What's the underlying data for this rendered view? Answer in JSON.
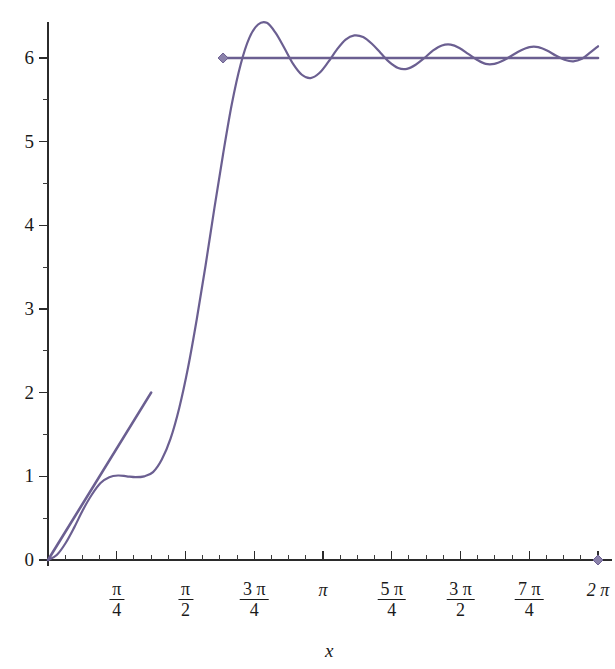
{
  "chart_data": {
    "type": "line",
    "title": "",
    "subtitle": "",
    "xlabel": "x",
    "ylabel": "",
    "grid": false,
    "legend": null,
    "xlim": [
      0,
      6.283185307179586
    ],
    "ylim": [
      0,
      6.45
    ],
    "x_tick_labels": [
      "",
      "π/4",
      "π/2",
      "3π/4",
      "π",
      "5π/4",
      "3π/2",
      "7π/4",
      "2π"
    ],
    "x_tick_values": [
      0,
      0.7853981634,
      1.5707963268,
      2.3561944902,
      3.1415926536,
      3.926990817,
      4.7123889804,
      5.4977871438,
      6.2831853072
    ],
    "x_minor_ticks_per_interval": 4,
    "y_tick_labels": [
      "0",
      "1",
      "2",
      "3",
      "4",
      "5",
      "6"
    ],
    "y_tick_values": [
      0,
      1,
      2,
      3,
      4,
      5,
      6
    ],
    "y_minor_ticks_per_interval": 2,
    "curve_color": "#6b5f91",
    "axis_color": "#2b2b2b",
    "marker_shape": "diamond",
    "markers": [
      {
        "x": 2.0,
        "y": 6.0,
        "label": "left-endpoint-marker"
      },
      {
        "x": 6.283185307179586,
        "y": 0.0,
        "label": "right-endpoint-marker"
      }
    ],
    "series": [
      {
        "name": "fourier-partial-sum",
        "description": "Gibbs-oscillating step approximation rising from 0 to about 6",
        "color": "#6b5f91",
        "points_x": [
          0.0,
          0.1,
          0.2,
          0.3,
          0.4,
          0.5,
          0.6,
          0.7,
          0.8,
          0.9,
          1.0,
          1.1,
          1.2,
          1.3,
          1.4,
          1.5,
          1.6,
          1.7,
          1.8,
          1.9,
          2.0,
          2.1,
          2.2,
          2.3,
          2.4,
          2.5,
          2.6,
          2.7,
          2.8,
          2.9,
          3.0,
          3.1,
          3.2,
          3.3,
          3.4,
          3.5,
          3.6,
          3.7,
          3.8,
          3.9,
          4.0,
          4.1,
          4.2,
          4.3,
          4.4,
          4.5,
          4.6,
          4.7,
          4.8,
          4.9,
          5.0,
          5.1,
          5.2,
          5.3,
          5.4,
          5.5,
          5.6,
          5.7,
          5.8,
          5.9,
          6.0,
          6.1,
          6.2,
          6.2832
        ],
        "points_y": [
          0.0,
          0.06,
          0.2,
          0.39,
          0.6,
          0.78,
          0.92,
          0.99,
          1.01,
          1.0,
          0.99,
          1.0,
          1.05,
          1.2,
          1.45,
          1.82,
          2.3,
          2.88,
          3.52,
          4.2,
          4.85,
          5.45,
          5.92,
          6.24,
          6.4,
          6.42,
          6.3,
          6.12,
          5.93,
          5.8,
          5.76,
          5.82,
          5.95,
          6.1,
          6.22,
          6.27,
          6.25,
          6.17,
          6.06,
          5.95,
          5.88,
          5.87,
          5.92,
          6.0,
          6.09,
          6.15,
          6.16,
          6.12,
          6.05,
          5.98,
          5.93,
          5.93,
          5.97,
          6.03,
          6.09,
          6.13,
          6.13,
          6.09,
          6.03,
          5.98,
          5.96,
          5.99,
          6.07,
          6.14
        ]
      },
      {
        "name": "tangent-line-segment",
        "description": "Straight line from origin rising to y=2",
        "color": "#6b5f91",
        "points_x": [
          0.0,
          1.1781
        ],
        "points_y": [
          0.0,
          2.0
        ]
      },
      {
        "name": "horizontal-limit-line",
        "description": "Horizontal line at y=6 starting at x=2",
        "color": "#6b5f91",
        "points_x": [
          2.0,
          6.2832
        ],
        "points_y": [
          6.0,
          6.0
        ]
      }
    ]
  },
  "axes": {
    "x_axis_name": "x-axis",
    "y_axis_name": "y-axis",
    "xlabel_text": "x"
  },
  "y_labels": [
    {
      "text": "0",
      "value": 0
    },
    {
      "text": "1",
      "value": 1
    },
    {
      "text": "2",
      "value": 2
    },
    {
      "text": "3",
      "value": 3
    },
    {
      "text": "4",
      "value": 4
    },
    {
      "text": "5",
      "value": 5
    },
    {
      "text": "6",
      "value": 6
    }
  ],
  "x_labels": [
    {
      "kind": "fraction",
      "numerator": "π",
      "denominator": "4",
      "value": 0.7853981634
    },
    {
      "kind": "fraction",
      "numerator": "π",
      "denominator": "2",
      "value": 1.5707963268
    },
    {
      "kind": "fraction",
      "numerator": "3 π",
      "denominator": "4",
      "value": 2.3561944902
    },
    {
      "kind": "plain",
      "text": "π",
      "value": 3.1415926536
    },
    {
      "kind": "fraction",
      "numerator": "5 π",
      "denominator": "4",
      "value": 3.926990817
    },
    {
      "kind": "fraction",
      "numerator": "3 π",
      "denominator": "2",
      "value": 4.7123889804
    },
    {
      "kind": "fraction",
      "numerator": "7 π",
      "denominator": "4",
      "value": 5.4977871438
    },
    {
      "kind": "plain",
      "text": "2 π",
      "value": 6.2831853072
    }
  ]
}
